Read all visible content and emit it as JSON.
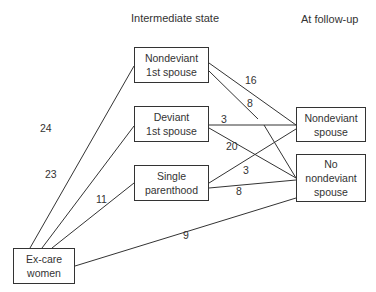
{
  "headers": {
    "intermediate": "Intermediate state",
    "follow_up": "At follow-up"
  },
  "nodes": {
    "ex_care": "Ex-care\nwomen",
    "nondeviant_first": "Nondeviant\n1st spouse",
    "deviant_first": "Deviant\n1st spouse",
    "single_parent": "Single\nparenthood",
    "nondeviant_spouse": "Nondeviant\nspouse",
    "no_nondeviant_spouse": "No\nnondeviant\nspouse"
  },
  "edges": [
    {
      "from": "Ex-care women",
      "to": "Nondeviant 1st spouse",
      "value": "24"
    },
    {
      "from": "Ex-care women",
      "to": "Deviant 1st spouse",
      "value": "23"
    },
    {
      "from": "Ex-care women",
      "to": "Single parenthood",
      "value": "11"
    },
    {
      "from": "Ex-care women",
      "to": "No nondeviant spouse",
      "value": "9"
    },
    {
      "from": "Nondeviant 1st spouse",
      "to": "Nondeviant spouse",
      "value": "16"
    },
    {
      "from": "Nondeviant 1st spouse",
      "to": "No nondeviant spouse",
      "value": "8"
    },
    {
      "from": "Deviant 1st spouse",
      "to": "Nondeviant spouse",
      "value": "3"
    },
    {
      "from": "Deviant 1st spouse",
      "to": "No nondeviant spouse",
      "value": "20"
    },
    {
      "from": "Single parenthood",
      "to": "Nondeviant spouse",
      "value": "3"
    },
    {
      "from": "Single parenthood",
      "to": "No nondeviant spouse",
      "value": "8"
    }
  ],
  "colors": {
    "line": "#333333",
    "background": "#ffffff"
  }
}
